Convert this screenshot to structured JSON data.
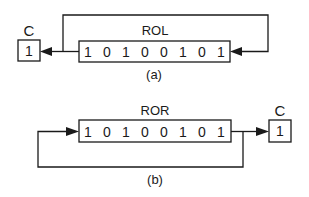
{
  "diagram_a": {
    "operation": "ROL",
    "caption": "(a)",
    "carry_label": "C",
    "carry_value": "1",
    "bits": [
      "1",
      "0",
      "1",
      "0",
      "0",
      "1",
      "0",
      "1"
    ]
  },
  "diagram_b": {
    "operation": "ROR",
    "caption": "(b)",
    "carry_label": "C",
    "carry_value": "1",
    "bits": [
      "1",
      "0",
      "1",
      "0",
      "0",
      "1",
      "0",
      "1"
    ]
  },
  "colors": {
    "stroke": "#1a1a1a",
    "background": "#ffffff"
  }
}
